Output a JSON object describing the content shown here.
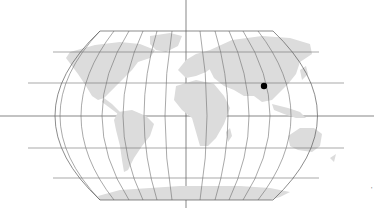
{
  "map": {
    "projection": "Robinson",
    "graticule_step_deg": 30,
    "land_color": "#dcdcdc",
    "grid_color": "#6e6e6e",
    "background": "#ffffff",
    "marker": {
      "label": "location-marker",
      "color": "#000000",
      "lon": 104,
      "lat": 30,
      "x": 264,
      "y": 86
    },
    "corner_mark": "'"
  }
}
